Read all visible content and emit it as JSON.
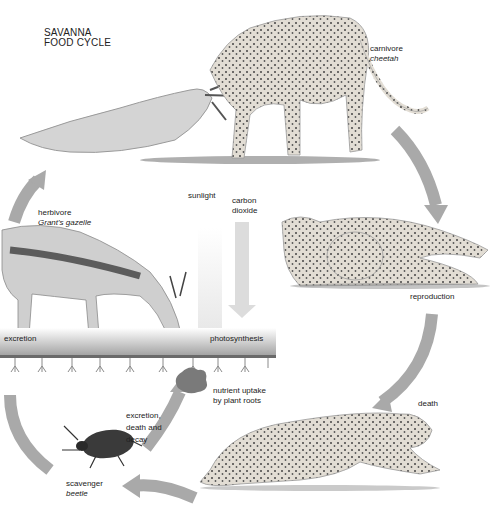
{
  "title": {
    "line1": "SAVANNA",
    "line2": "FOOD CYCLE"
  },
  "labels": {
    "carnivore": {
      "role": "carnivore",
      "species": "cheetah"
    },
    "herbivore": {
      "role": "herbivore",
      "species": "Grant's gazelle"
    },
    "scavenger": {
      "role": "scavenger",
      "species": "beetle"
    },
    "sunlight": "sunlight",
    "carbon_dioxide": {
      "line1": "carbon",
      "line2": "dioxide"
    },
    "excretion": "excretion",
    "photosynthesis": "photosynthesis",
    "nutrient_uptake": {
      "line1": "nutrient uptake",
      "line2": "by plant roots"
    },
    "decay": {
      "line1": "excretion,",
      "line2": "death and",
      "line3": "decay"
    },
    "reproduction": "reproduction",
    "death": "death"
  },
  "colors": {
    "arrow": "#a9a9a9",
    "ink": "#222222",
    "spots": "#3c3c3c",
    "fur": "#d8d2c8"
  }
}
